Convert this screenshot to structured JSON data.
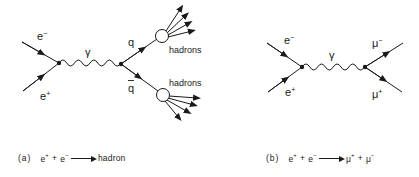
{
  "diagrams": [
    {
      "id": "a",
      "labels": {
        "electron": "e",
        "electron_sup": "−",
        "positron": "e",
        "positron_sup": "+",
        "photon": "γ",
        "quark": "q",
        "antiquark": "q",
        "hadrons_top": "hadrons",
        "hadrons_bottom": "hadrons"
      },
      "caption": {
        "tag": "(a)",
        "lhs1": "e",
        "lhs1_sup": "+",
        "plus": "+",
        "lhs2": "e",
        "lhs2_sup": "−",
        "rhs": "hadron"
      }
    },
    {
      "id": "b",
      "labels": {
        "electron": "e",
        "electron_sup": "−",
        "positron": "e",
        "positron_sup": "+",
        "photon": "γ",
        "muon_minus": "μ",
        "muon_minus_sup": "−",
        "muon_plus": "μ",
        "muon_plus_sup": "+"
      },
      "caption": {
        "tag": "(b)",
        "lhs1": "e",
        "lhs1_sup": "+",
        "plus1": "+",
        "lhs2": "e",
        "lhs2_sup": "−",
        "rhs1": "μ",
        "rhs1_sup": "+",
        "plus2": "+",
        "rhs2": "μ",
        "rhs2_sup": "−"
      }
    }
  ],
  "colors": {
    "ink": "#1a1a1a",
    "background": "#ffffff"
  }
}
